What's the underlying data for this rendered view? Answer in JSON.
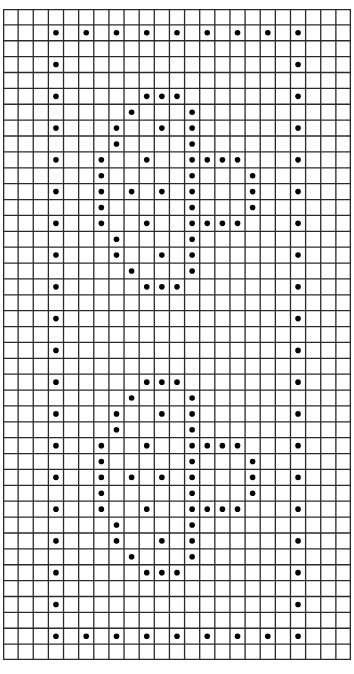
{
  "diagram": {
    "type": "dot-grid-pattern",
    "grid": {
      "columns": 23,
      "rows": 41,
      "line_color": "#2a2a2a",
      "background": "#ffffff"
    },
    "dot": {
      "color": "#000000",
      "radius": 2.8
    },
    "border_dots": {
      "description": "rectangular frame of dots on every other cell",
      "top_row": 1,
      "bottom_row": 39,
      "left_col": 3,
      "right_col": 19,
      "step": 2
    },
    "motifs": [
      {
        "name": "upper-motif",
        "row_offset": 5
      },
      {
        "name": "lower-motif",
        "row_offset": 23
      }
    ],
    "motif_pattern": [
      [
        0,
        [
          9,
          10,
          11
        ]
      ],
      [
        1,
        [
          8,
          12
        ]
      ],
      [
        2,
        [
          7,
          10,
          12
        ]
      ],
      [
        3,
        [
          7,
          12
        ]
      ],
      [
        4,
        [
          6,
          9,
          12,
          13,
          14,
          15
        ]
      ],
      [
        5,
        [
          6,
          12,
          16
        ]
      ],
      [
        6,
        [
          6,
          8,
          10,
          12,
          16
        ]
      ],
      [
        7,
        [
          6,
          12,
          16
        ]
      ],
      [
        8,
        [
          6,
          9,
          12,
          13,
          14,
          15
        ]
      ],
      [
        9,
        [
          7,
          12
        ]
      ],
      [
        10,
        [
          7,
          10,
          12
        ]
      ],
      [
        11,
        [
          8,
          12
        ]
      ],
      [
        12,
        [
          9,
          10,
          11
        ]
      ]
    ]
  }
}
